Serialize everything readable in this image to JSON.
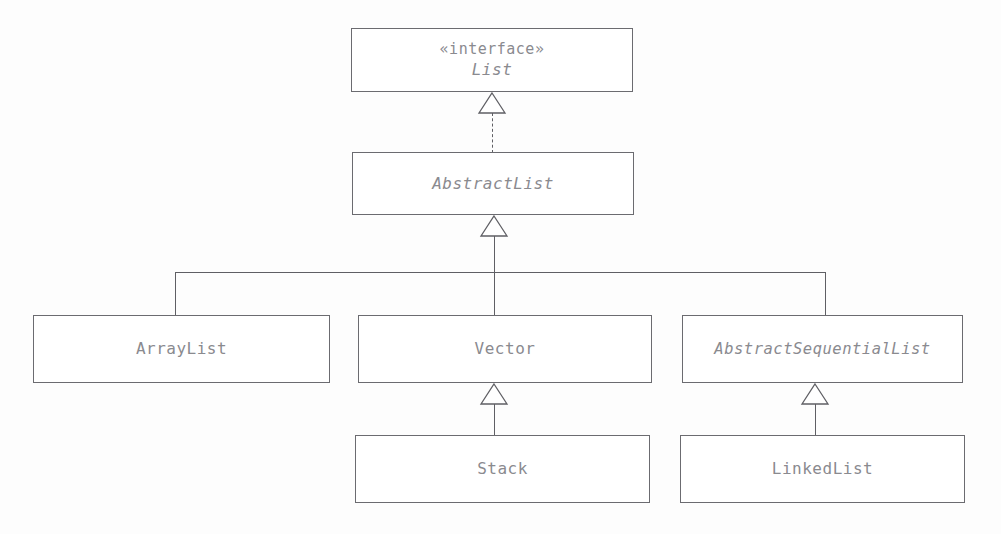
{
  "diagram": {
    "kind": "uml-class-diagram",
    "background_color": "#fdfdfd",
    "line_color": "#5f5f64",
    "text_color": "#8a8a8f",
    "box_border_color": "#6b6b70",
    "box_fill_color": "#ffffff"
  },
  "nodes": [
    {
      "id": "list",
      "stereotype": "«interface»",
      "name": "List",
      "abstract": true,
      "x": 351,
      "y": 28,
      "w": 282,
      "h": 64
    },
    {
      "id": "abstractlist",
      "stereotype": "",
      "name": "AbstractList",
      "abstract": true,
      "x": 352,
      "y": 152,
      "w": 282,
      "h": 63
    },
    {
      "id": "arraylist",
      "stereotype": "",
      "name": "ArrayList",
      "abstract": false,
      "x": 33,
      "y": 315,
      "w": 297,
      "h": 68
    },
    {
      "id": "vector",
      "stereotype": "",
      "name": "Vector",
      "abstract": false,
      "x": 358,
      "y": 315,
      "w": 294,
      "h": 68
    },
    {
      "id": "abstractsequentiallist",
      "stereotype": "",
      "name": "AbstractSequentialList",
      "abstract": true,
      "x": 682,
      "y": 315,
      "w": 281,
      "h": 68
    },
    {
      "id": "stack",
      "stereotype": "",
      "name": "Stack",
      "abstract": false,
      "x": 355,
      "y": 435,
      "w": 295,
      "h": 68
    },
    {
      "id": "linkedlist",
      "stereotype": "",
      "name": "LinkedList",
      "abstract": false,
      "x": 680,
      "y": 435,
      "w": 285,
      "h": 68
    }
  ],
  "edges": [
    {
      "id": "e1",
      "from": "abstractlist",
      "to": "list",
      "type": "realization",
      "style": "dashed",
      "arrow": "hollow-triangle"
    },
    {
      "id": "e2",
      "from": "children-bus",
      "to": "abstractlist",
      "type": "generalization",
      "style": "solid",
      "arrow": "hollow-triangle"
    },
    {
      "id": "e3",
      "from": "arraylist",
      "to": "abstractlist",
      "type": "generalization",
      "style": "solid",
      "arrow": "none"
    },
    {
      "id": "e4",
      "from": "vector",
      "to": "abstractlist",
      "type": "generalization",
      "style": "solid",
      "arrow": "none"
    },
    {
      "id": "e5",
      "from": "abstractsequentiallist",
      "to": "abstractlist",
      "type": "generalization",
      "style": "solid",
      "arrow": "none"
    },
    {
      "id": "e6",
      "from": "stack",
      "to": "vector",
      "type": "generalization",
      "style": "solid",
      "arrow": "hollow-triangle"
    },
    {
      "id": "e7",
      "from": "linkedlist",
      "to": "abstractsequentiallist",
      "type": "generalization",
      "style": "solid",
      "arrow": "hollow-triangle"
    }
  ]
}
